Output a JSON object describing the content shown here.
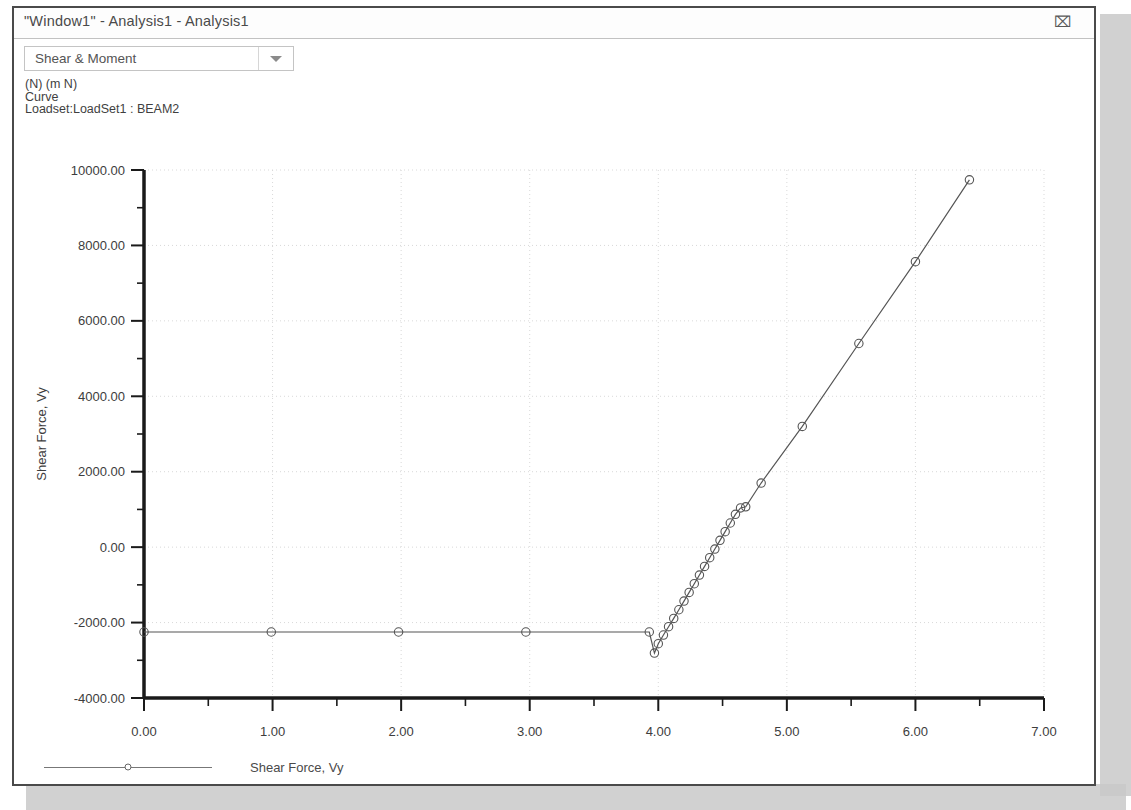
{
  "window": {
    "title": "\"Window1\" - Analysis1 - Analysis1",
    "restore_icon": "restore-icon",
    "restore_glyph": "⌧"
  },
  "toolbar": {
    "dropdown_value": "Shear & Moment",
    "dropdown_arrow_icon": "chevron-down-icon"
  },
  "subtitle": {
    "line1": "(N)  (m N)",
    "line2": "Curve",
    "line3": "Loadset:LoadSet1 :  BEAM2"
  },
  "legend": {
    "entry_label": "Shear Force, Vy"
  },
  "colors": {
    "curve": "#555555",
    "axis": "#1a1a1a",
    "grid": "#d9d9d9",
    "text": "#3d3d3d",
    "window_border": "#4a4a4a"
  },
  "chart_data": {
    "type": "line",
    "title": "",
    "xlabel": "Curve Arc Length (m)",
    "ylabel": "Shear Force, Vy",
    "xlim": [
      0,
      7
    ],
    "ylim": [
      -4000,
      10000
    ],
    "xticks": [
      0,
      1,
      2,
      3,
      4,
      5,
      6,
      7
    ],
    "xtick_labels": [
      "0.00",
      "1.00",
      "2.00",
      "3.00",
      "4.00",
      "5.00",
      "6.00",
      "7.00"
    ],
    "yticks": [
      -4000,
      -2000,
      0,
      2000,
      4000,
      6000,
      8000,
      10000
    ],
    "ytick_labels": [
      "-4000.00",
      "-2000.00",
      "0.00",
      "2000.00",
      "4000.00",
      "6000.00",
      "8000.00",
      "10000.00"
    ],
    "xminor_step": 0.5,
    "yminor_step": 1000,
    "grid": true,
    "grid_style": "dotted",
    "legend_position": "bottom-left",
    "marker": "circle",
    "series": [
      {
        "name": "Shear Force, Vy",
        "x": [
          0.0,
          0.99,
          1.98,
          2.97,
          3.93,
          3.97,
          4.0,
          4.04,
          4.08,
          4.12,
          4.16,
          4.2,
          4.24,
          4.28,
          4.32,
          4.36,
          4.4,
          4.44,
          4.48,
          4.52,
          4.56,
          4.6,
          4.64,
          4.68,
          4.8,
          5.12,
          5.56,
          6.0,
          6.42
        ],
        "y": [
          -2250,
          -2250,
          -2250,
          -2250,
          -2250,
          -2810,
          -2560,
          -2330,
          -2110,
          -1890,
          -1660,
          -1430,
          -1200,
          -970,
          -740,
          -510,
          -280,
          -50,
          180,
          410,
          640,
          870,
          1040,
          1070,
          1700,
          3200,
          5400,
          7570,
          9740
        ]
      }
    ]
  }
}
